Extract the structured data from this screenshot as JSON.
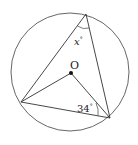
{
  "diagram": {
    "type": "circle-geometry",
    "circle": {
      "cx": 70,
      "cy": 72,
      "r": 59,
      "stroke": "#555555"
    },
    "center": {
      "x": 71,
      "y": 73,
      "label": "O"
    },
    "vertices": {
      "top": {
        "x": 86,
        "y": 14
      },
      "left": {
        "x": 21,
        "y": 102
      },
      "right": {
        "x": 110,
        "y": 118
      }
    },
    "angles": {
      "top": {
        "label_var": "x",
        "label_deg": "°"
      },
      "right": {
        "label_num": "34",
        "label_deg": "°"
      }
    },
    "colors": {
      "line": "#333333",
      "dot": "#111111"
    }
  }
}
